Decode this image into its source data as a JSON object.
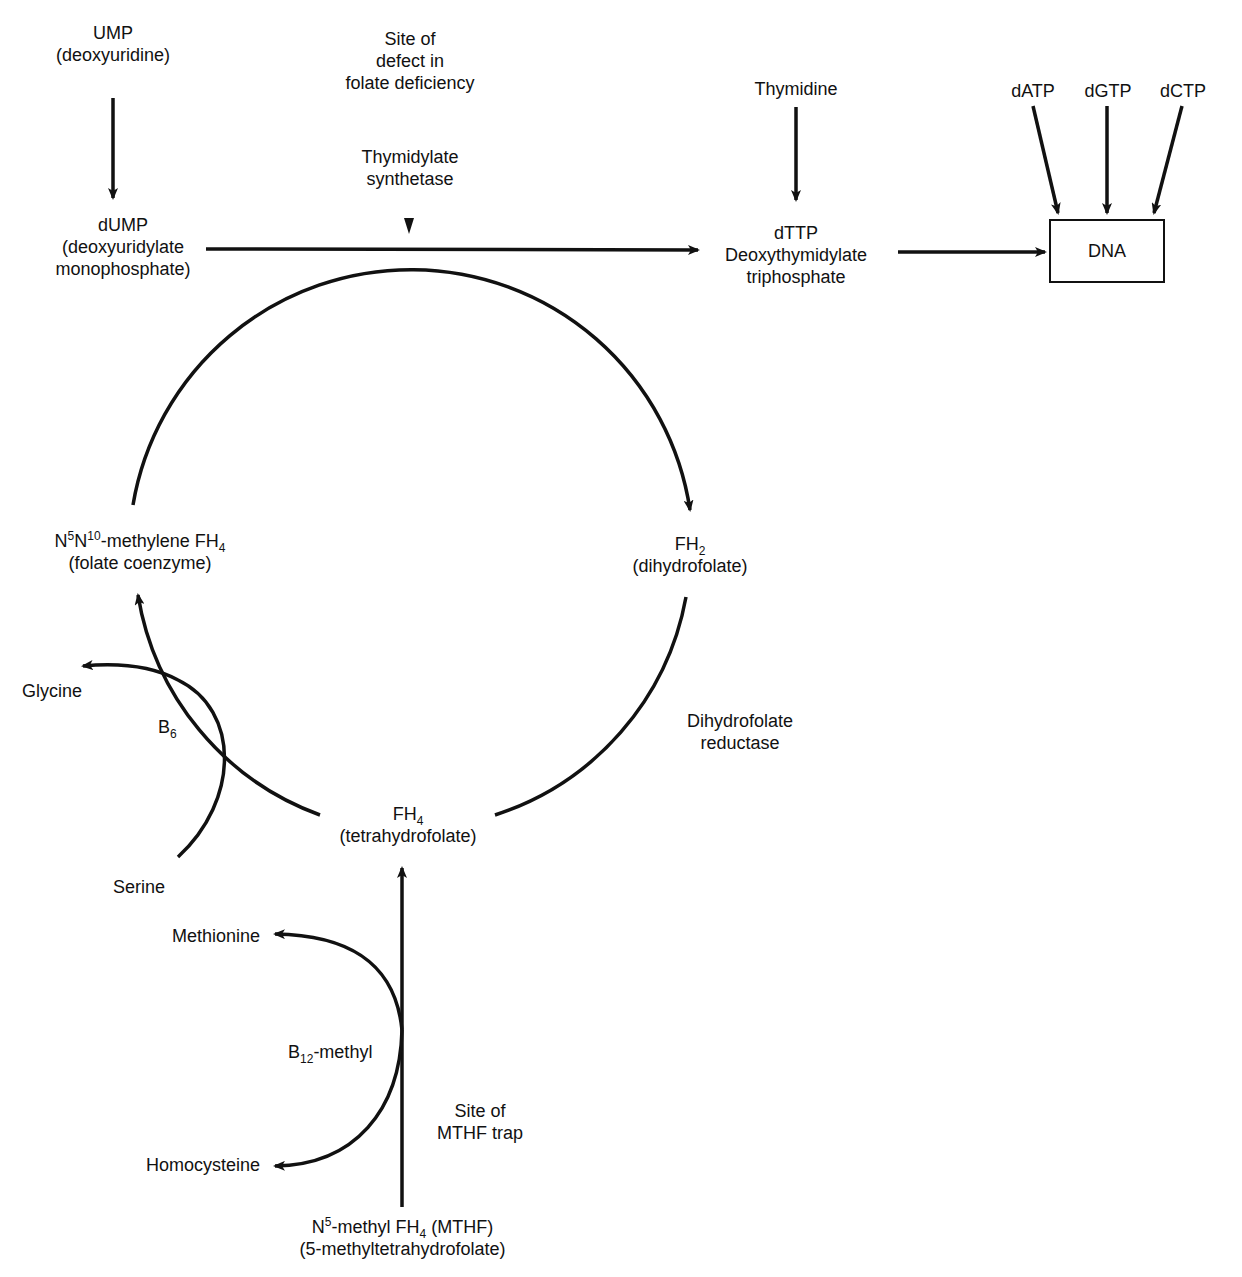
{
  "colors": {
    "ink": "#111111",
    "background": "#ffffff"
  },
  "nodes": {
    "ump": {
      "line1": "UMP",
      "line2": "(deoxyuridine)"
    },
    "site_defect": {
      "line1": "Site of",
      "line2": "defect in",
      "line3": "folate deficiency"
    },
    "thymidylate_synthetase": {
      "line1": "Thymidylate",
      "line2": "synthetase"
    },
    "thymidine": {
      "line1": "Thymidine"
    },
    "datp": "dATP",
    "dgtp": "dGTP",
    "dctp": "dCTP",
    "dna": "DNA",
    "dump": {
      "line1": "dUMP",
      "line2": "(deoxyuridylate",
      "line3": "monophosphate)"
    },
    "dttp": {
      "line1": "dTTP",
      "line2": "Deoxythymidylate",
      "line3": "triphosphate"
    },
    "methylene_fh4": {
      "prefix": "N",
      "sup1": "5",
      "mid": "N",
      "sup2": "10",
      "text": "-methylene FH",
      "sub": "4",
      "line2": "(folate coenzyme)"
    },
    "fh2": {
      "text": "FH",
      "sub": "2",
      "line2": "(dihydrofolate)"
    },
    "glycine": "Glycine",
    "b6": {
      "text": "B",
      "sub": "6"
    },
    "dihydrofolate_reductase": {
      "line1": "Dihydrofolate",
      "line2": "reductase"
    },
    "fh4": {
      "text": "FH",
      "sub": "4",
      "line2": "(tetrahydrofolate)"
    },
    "serine": "Serine",
    "methionine": "Methionine",
    "b12": {
      "text": "B",
      "sub": "12",
      "suffix": "-methyl"
    },
    "site_mthf": {
      "line1": "Site of",
      "line2": "MTHF trap"
    },
    "homocysteine": "Homocysteine",
    "mthf": {
      "prefix": "N",
      "sup": "5",
      "text": "-methyl FH",
      "sub": "4",
      "suffix": " (MTHF)",
      "line2": "(5-methyltetrahydrofolate)"
    }
  },
  "edges": [
    {
      "from": "UMP",
      "to": "dUMP"
    },
    {
      "from": "dUMP",
      "to": "dTTP",
      "via": "Thymidylate synthetase"
    },
    {
      "from": "Thymidine",
      "to": "dTTP"
    },
    {
      "from": "dTTP",
      "to": "DNA"
    },
    {
      "from": "dATP",
      "to": "DNA"
    },
    {
      "from": "dGTP",
      "to": "DNA"
    },
    {
      "from": "dCTP",
      "to": "DNA"
    },
    {
      "from": "N5N10-methylene FH4",
      "to": "FH2"
    },
    {
      "from": "FH2",
      "to": "FH4",
      "via": "Dihydrofolate reductase"
    },
    {
      "from": "FH4",
      "to": "N5N10-methylene FH4",
      "via": "B6"
    },
    {
      "from": "Serine",
      "to": "Glycine",
      "via": "B6"
    },
    {
      "from": "N5-methyl FH4 (MTHF)",
      "to": "FH4",
      "via": "B12-methyl"
    },
    {
      "from": "Homocysteine",
      "to": "Methionine",
      "via": "B12-methyl"
    }
  ]
}
